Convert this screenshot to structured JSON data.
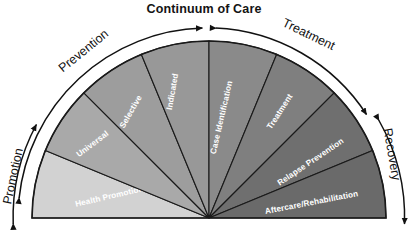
{
  "figure": {
    "title": "Continuum of Care",
    "type": "semicircle-fan-diagram",
    "background_color": "#ffffff",
    "outline_color": "#1a1a1a",
    "wedge_label_color": "#ffffff",
    "arc_label_color": "#111111"
  },
  "wedges": [
    {
      "label": "Health Promotion",
      "color": "#d2d2d2",
      "order": 1
    },
    {
      "label": "Universal",
      "color": "#a9a9a9",
      "order": 2
    },
    {
      "label": "Selective",
      "color": "#9d9d9d",
      "order": 3
    },
    {
      "label": "Indicated",
      "color": "#989898",
      "order": 4
    },
    {
      "label": "Case Identification",
      "color": "#8a8a8a",
      "order": 5
    },
    {
      "label": "Treatment",
      "color": "#7f7f7f",
      "order": 6
    },
    {
      "label": "Relapse Prevention",
      "color": "#6f6f6f",
      "order": 7
    },
    {
      "label": "Aftercare/Rehabilitation",
      "color": "#6a6a6a",
      "order": 8
    }
  ],
  "arcs": [
    {
      "label": "Promotion",
      "position": "left",
      "arrow": "double"
    },
    {
      "label": "Prevention",
      "position": "upper-left",
      "arrow": "double"
    },
    {
      "label": "Treatment",
      "position": "upper-right",
      "arrow": "double"
    },
    {
      "label": "Recovery",
      "position": "right",
      "arrow": "double"
    }
  ]
}
